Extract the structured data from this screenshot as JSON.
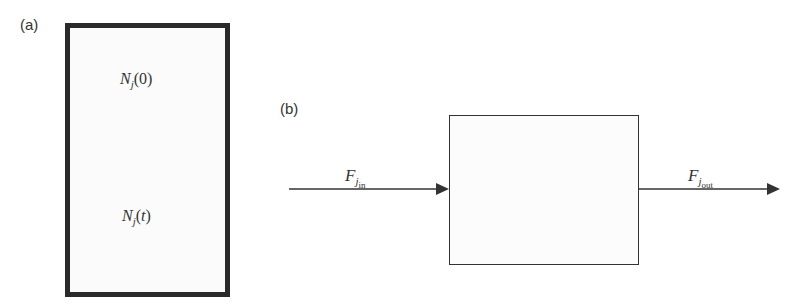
{
  "panel_a": {
    "label": "(a)",
    "top_quantity": {
      "symbol": "N",
      "subscript": "j",
      "arg": "(0)"
    },
    "bottom_quantity": {
      "symbol": "N",
      "subscript": "j",
      "arg_open": "(",
      "arg_var": "t",
      "arg_close": ")"
    }
  },
  "panel_b": {
    "label": "(b)",
    "inflow": {
      "symbol": "F",
      "subscript": "j",
      "subsub": "in"
    },
    "outflow": {
      "symbol": "F",
      "subscript": "j",
      "subsub": "out"
    }
  },
  "colors": {
    "stroke": "#333333",
    "tank_border": "#2a2a2a"
  }
}
